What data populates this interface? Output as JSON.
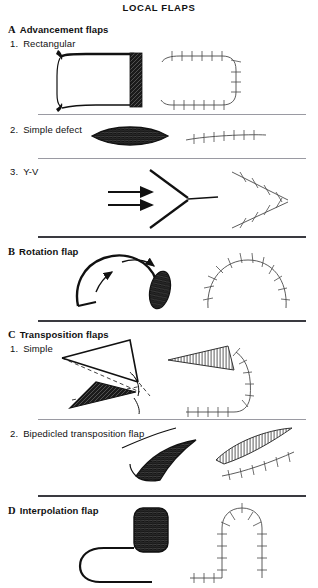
{
  "figure": {
    "title": "LOCAL FLAPS",
    "sections": [
      {
        "letter": "A",
        "label": "Advancement flaps",
        "items": [
          {
            "num": "1.",
            "label": "Rectangular"
          },
          {
            "num": "2.",
            "label": "Simple defect"
          },
          {
            "num": "3.",
            "label": "Y-V"
          }
        ]
      },
      {
        "letter": "B",
        "label": "Rotation flap",
        "items": []
      },
      {
        "letter": "C",
        "label": "Transposition flaps",
        "items": [
          {
            "num": "1.",
            "label": "Simple"
          },
          {
            "num": "2.",
            "label": "Bipedicled transposition flap"
          }
        ]
      },
      {
        "letter": "D",
        "label": "Interpolation flap",
        "items": []
      }
    ],
    "colors": {
      "ink": "#111111",
      "rule_thin": "#9a9aa2",
      "rule_thick": "#3a3a40",
      "paper": "#ffffff",
      "defect_fill": "#1a1a1a",
      "hatch": "#555555"
    }
  }
}
